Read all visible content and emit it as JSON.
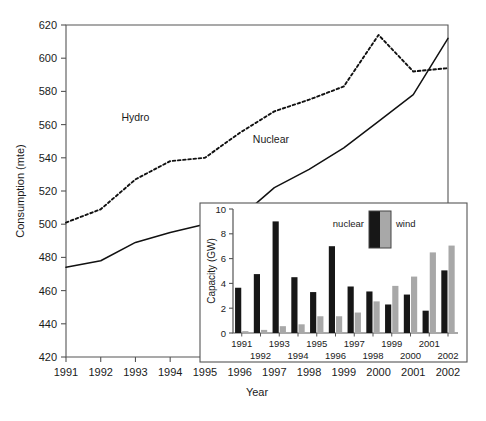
{
  "figure": {
    "background": "#ffffff",
    "axis_color": "#555555",
    "text_color": "#1a1a1a"
  },
  "chart_data": [
    {
      "id": "main",
      "type": "line",
      "title": "",
      "xlabel": "Year",
      "ylabel": "Consumption (mte)",
      "xlim": [
        1991,
        2002
      ],
      "ylim": [
        420,
        620
      ],
      "yticks": [
        420,
        440,
        460,
        480,
        500,
        520,
        540,
        560,
        580,
        600,
        620
      ],
      "xticks": [
        1991,
        1992,
        1993,
        1994,
        1995,
        1996,
        1997,
        1998,
        1999,
        2000,
        2001,
        2002
      ],
      "grid": false,
      "legend_position": "inline-annotation",
      "x": [
        1991,
        1992,
        1993,
        1994,
        1995,
        1996,
        1997,
        1998,
        1999,
        2000,
        2001,
        2002
      ],
      "series": [
        {
          "name": "Hydro",
          "style": "dotted",
          "color": "#111111",
          "values": [
            501,
            509,
            527,
            538,
            540,
            555,
            568,
            575,
            583,
            614,
            592,
            594
          ],
          "label_x": 1993.0,
          "label_y": 562
        },
        {
          "name": "Nuclear",
          "style": "solid",
          "color": "#111111",
          "values": [
            474,
            478,
            489,
            495,
            500,
            504,
            522,
            533,
            546,
            562,
            578,
            612
          ],
          "label_x": 1996.9,
          "label_y": 549
        }
      ],
      "annotations": [
        {
          "text": "Hydro",
          "x": 1993.0,
          "y": 562
        },
        {
          "text": "Nuclear",
          "x": 1996.9,
          "y": 549
        }
      ]
    },
    {
      "id": "inset",
      "type": "bar",
      "title": "",
      "xlabel": "",
      "ylabel": "Capacity (GW)",
      "ylim": [
        0,
        10
      ],
      "yticks": [
        0,
        2,
        4,
        6,
        8,
        10
      ],
      "categories": [
        "1991",
        "1992",
        "1993",
        "1994",
        "1995",
        "1996",
        "1997",
        "1998",
        "1999",
        "2000",
        "2001",
        "2002"
      ],
      "grid": false,
      "legend_position": "top-center",
      "series": [
        {
          "name": "nuclear",
          "color": "#171717",
          "values": [
            3.65,
            4.75,
            9.0,
            4.5,
            3.3,
            7.0,
            3.75,
            3.35,
            2.3,
            3.1,
            1.8,
            5.05
          ]
        },
        {
          "name": "wind",
          "color": "#a8a8a8",
          "values": [
            0.15,
            0.25,
            0.55,
            0.7,
            1.35,
            1.35,
            1.65,
            2.55,
            3.8,
            4.55,
            6.5,
            7.05
          ]
        }
      ]
    }
  ],
  "main_axis": {
    "ylabel": "Consumption (mte)",
    "xlabel": "Year",
    "yticks": [
      "420",
      "440",
      "460",
      "480",
      "500",
      "520",
      "540",
      "560",
      "580",
      "600",
      "620"
    ],
    "xticks": [
      "1991",
      "1992",
      "1993",
      "1994",
      "1995",
      "1996",
      "1997",
      "1998",
      "1999",
      "2000",
      "2001",
      "2002"
    ]
  },
  "main_labels": {
    "hydro": "Hydro",
    "nuclear": "Nuclear"
  },
  "inset_axis": {
    "ylabel": "Capacity (GW)",
    "yticks": [
      "0",
      "2",
      "4",
      "6",
      "8",
      "10"
    ],
    "xticks_top_row": [
      "1991",
      "1993",
      "1995",
      "1997",
      "1999",
      "2001"
    ],
    "xticks_bottom_row": [
      "1992",
      "1994",
      "1996",
      "1998",
      "2000",
      "2002"
    ]
  },
  "inset_legend": {
    "nuclear_label": "nuclear",
    "wind_label": "wind",
    "nuclear_color": "#171717",
    "wind_color": "#a8a8a8"
  }
}
